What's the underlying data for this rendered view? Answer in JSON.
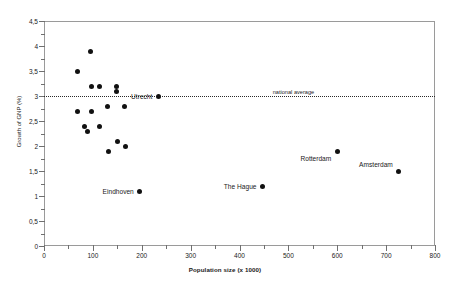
{
  "chart_data": {
    "type": "scatter",
    "title": "",
    "xlabel": "Population size (x 1000)",
    "ylabel": "Growth of GNP (%)",
    "xlim": [
      0,
      800
    ],
    "ylim": [
      0,
      4.5
    ],
    "grid": false,
    "legend": null,
    "x_ticks": [
      0,
      100,
      200,
      300,
      400,
      500,
      600,
      700,
      800
    ],
    "x_tick_labels": [
      "0",
      "100",
      "200",
      "300",
      "400",
      "500",
      "600",
      "700",
      "800"
    ],
    "x_minor_ticks": [
      50,
      150,
      250,
      350,
      450,
      550,
      650,
      750
    ],
    "y_ticks": [
      0,
      0.5,
      1,
      1.5,
      2,
      2.5,
      3,
      3.5,
      4,
      4.5
    ],
    "y_tick_labels": [
      "0",
      "0,5",
      "1",
      "1,5",
      "2",
      "2,5",
      "3",
      "3,5",
      "4",
      "4,5"
    ],
    "y_minor_ticks": [
      0.25,
      0.75,
      1.25,
      1.75,
      2.25,
      2.75,
      3.25,
      3.75,
      4.25
    ],
    "marker_color": "#111111",
    "frame_color": "#9a9a9a",
    "reference_lines": [
      {
        "name": "national-average",
        "orientation": "horizontal",
        "value": 3.0,
        "label": "national average",
        "style": "dotted"
      }
    ],
    "points": [
      {
        "x": 68,
        "y": 3.5,
        "label": ""
      },
      {
        "x": 68,
        "y": 2.7,
        "label": ""
      },
      {
        "x": 82,
        "y": 2.4,
        "label": ""
      },
      {
        "x": 90,
        "y": 2.3,
        "label": ""
      },
      {
        "x": 95,
        "y": 3.9,
        "label": ""
      },
      {
        "x": 98,
        "y": 3.2,
        "label": ""
      },
      {
        "x": 98,
        "y": 2.7,
        "label": ""
      },
      {
        "x": 113,
        "y": 3.2,
        "label": ""
      },
      {
        "x": 113,
        "y": 2.4,
        "label": ""
      },
      {
        "x": 130,
        "y": 2.8,
        "label": ""
      },
      {
        "x": 131,
        "y": 1.9,
        "label": ""
      },
      {
        "x": 149,
        "y": 3.2,
        "label": ""
      },
      {
        "x": 149,
        "y": 3.1,
        "label": ""
      },
      {
        "x": 150,
        "y": 2.1,
        "label": ""
      },
      {
        "x": 165,
        "y": 2.8,
        "label": ""
      },
      {
        "x": 166,
        "y": 2.0,
        "label": ""
      },
      {
        "x": 196,
        "y": 1.1,
        "label": "Eindhoven"
      },
      {
        "x": 234,
        "y": 3.0,
        "label": "Utrecht"
      },
      {
        "x": 447,
        "y": 1.2,
        "label": "The Hague"
      },
      {
        "x": 600,
        "y": 1.9,
        "label": "Rotterdam"
      },
      {
        "x": 726,
        "y": 1.5,
        "label": "Amsterdam"
      }
    ],
    "annotations": [
      {
        "name": "utrecht",
        "text": "Utrecht",
        "x": 234,
        "y": 3.0,
        "placement": "left"
      },
      {
        "name": "eindhoven",
        "text": "Eindhoven",
        "x": 196,
        "y": 1.1,
        "placement": "left"
      },
      {
        "name": "the-hague",
        "text": "The Hague",
        "x": 447,
        "y": 1.2,
        "placement": "left"
      },
      {
        "name": "rotterdam",
        "text": "Rotterdam",
        "x": 600,
        "y": 1.9,
        "placement": "left-below"
      },
      {
        "name": "amsterdam",
        "text": "Amsterdam",
        "x": 726,
        "y": 1.5,
        "placement": "left-above"
      }
    ]
  }
}
